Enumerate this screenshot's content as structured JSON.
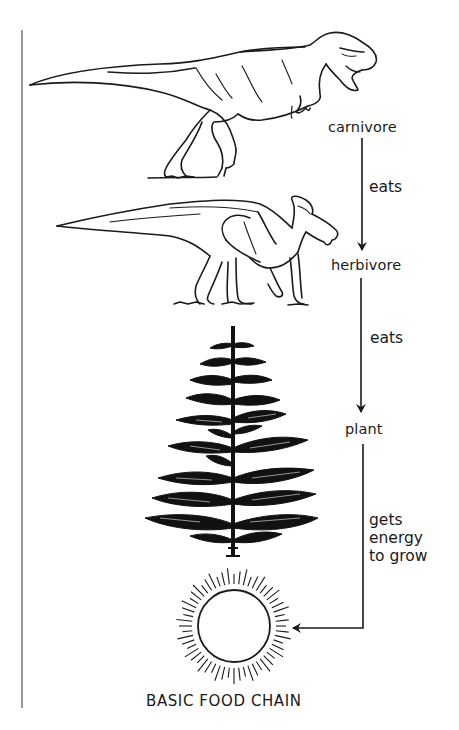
{
  "diagram": {
    "title": "BASIC FOOD CHAIN",
    "type": "food-chain",
    "colors": {
      "ink": "#1a1a1a",
      "background": "#ffffff",
      "border_line": "#555555"
    },
    "nodes": [
      {
        "id": "carnivore",
        "label": "carnivore",
        "illustration": "tyrannosaurus-rex"
      },
      {
        "id": "herbivore",
        "label": "herbivore",
        "illustration": "parasaurolophus"
      },
      {
        "id": "plant",
        "label": "plant",
        "illustration": "conifer-tree"
      },
      {
        "id": "sun",
        "label": "",
        "illustration": "sun"
      }
    ],
    "edges": [
      {
        "from": "carnivore",
        "to": "herbivore",
        "label": "eats"
      },
      {
        "from": "herbivore",
        "to": "plant",
        "label": "eats"
      },
      {
        "from": "plant",
        "to": "sun",
        "label": "gets energy to grow",
        "label_lines": [
          "gets",
          "energy",
          "to grow"
        ]
      }
    ]
  }
}
